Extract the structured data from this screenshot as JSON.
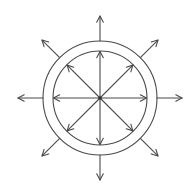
{
  "diagram": {
    "center": [
      100,
      98
    ],
    "inner_radius": 47,
    "outer_radius": 57,
    "outward_arrow_length": 25,
    "directions_deg": [
      0,
      45,
      90,
      135,
      180,
      225,
      270,
      315
    ],
    "line_color": "#4a4a4a",
    "arrowhead": {
      "length": 7,
      "half_angle_deg": 28
    },
    "inner_arrows": {
      "label": "center-to-inner-ring arrows",
      "count": 8
    },
    "outer_arrows": {
      "label": "outer-ring outward arrows",
      "count": 8
    }
  }
}
